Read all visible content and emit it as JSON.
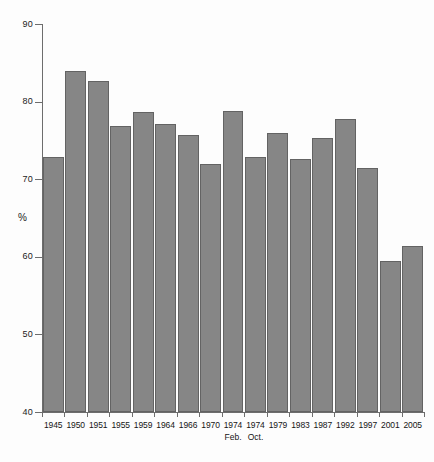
{
  "chart_data": {
    "type": "bar",
    "title": "",
    "subtitle": "",
    "xlabel": "",
    "ylabel": "%",
    "ylim": [
      40,
      90
    ],
    "ytick_values": [
      40,
      50,
      60,
      70,
      80,
      90
    ],
    "ytick_labels": [
      "40",
      "50",
      "60",
      "70",
      "80",
      "90"
    ],
    "grid": false,
    "legend": null,
    "bar_color": "#868686",
    "bar_edge_color": "#636363",
    "axis_color": "#6d6d6d",
    "background_color": "#fdfdfd",
    "categories": [
      "1945",
      "1950",
      "1951",
      "1955",
      "1959",
      "1964",
      "1966",
      "1970",
      "1974",
      "1974",
      "1979",
      "1983",
      "1987",
      "1992",
      "1997",
      "2001",
      "2005"
    ],
    "category_sublabels": [
      "",
      "",
      "",
      "",
      "",
      "",
      "",
      "",
      "Feb.",
      "Oct.",
      "",
      "",
      "",
      "",
      "",
      "",
      ""
    ],
    "values": [
      72.8,
      84.0,
      82.6,
      76.8,
      78.7,
      77.1,
      75.7,
      72.0,
      78.8,
      72.8,
      76.0,
      72.6,
      75.3,
      77.7,
      71.4,
      59.4,
      61.4
    ],
    "series": [
      {
        "name": "Turnout",
        "values": [
          72.8,
          84.0,
          82.6,
          76.8,
          78.7,
          77.1,
          75.7,
          72.0,
          78.8,
          72.8,
          76.0,
          72.6,
          75.3,
          77.7,
          71.4,
          59.4,
          61.4
        ]
      }
    ]
  }
}
